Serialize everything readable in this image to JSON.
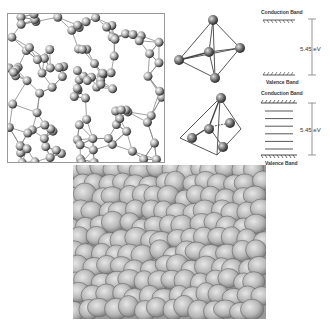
{
  "figure": {
    "panels": [
      {
        "id": "amorphous-network",
        "description": "Amorphous silicon network of atoms and bonds"
      },
      {
        "id": "tetrahedra",
        "description": "Tetrahedral coordination units (ideal and distorted)"
      },
      {
        "id": "band-diagrams",
        "description": "Energy band diagrams"
      },
      {
        "id": "sphere-packing",
        "description": "Random close packing of spheres"
      }
    ]
  },
  "bands": {
    "top": {
      "conduction_label": "Conduction Band",
      "valence_label": "Valence Band",
      "gap_label": "5.45 eV"
    },
    "bottom": {
      "conduction_label": "Conduction Band",
      "valence_label": "Valence Band",
      "gap_label": "5.45 eV",
      "gap_states_count": 6
    }
  },
  "colors": {
    "sphere_fill": "#b8b8b8",
    "sphere_edge": "#666666",
    "atom_dark": "#333333",
    "line": "#555555"
  }
}
